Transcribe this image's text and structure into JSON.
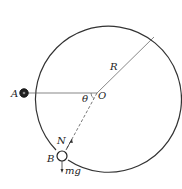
{
  "diagram": {
    "title": "",
    "labels": {
      "point_a": "A",
      "point_b": "B",
      "center": "O",
      "radius": "R",
      "angle": "θ",
      "normal_force": "N",
      "weight": "mg"
    },
    "colors": {
      "stroke": "#333333",
      "bead_fill_a": "#222222",
      "bead_fill_b": "#ffffff",
      "background": "#ffffff"
    }
  }
}
